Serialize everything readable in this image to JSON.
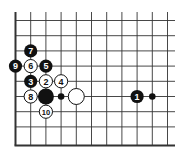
{
  "diagram": {
    "type": "go-board-corner",
    "colors": {
      "background": "#ffffff",
      "line": "#333333",
      "black_stone": "#111111",
      "white_stone": "#ffffff",
      "black_label": "#ffffff",
      "white_label": "#111111"
    },
    "grid": {
      "columns": 11,
      "rows": 9,
      "left_edge": true,
      "bottom_edge": true
    },
    "stones": [
      {
        "col": 8,
        "row": 5,
        "color": "black",
        "label": "1",
        "kind": "move"
      },
      {
        "col": 2,
        "row": 4,
        "color": "white",
        "label": "2",
        "kind": "move"
      },
      {
        "col": 1,
        "row": 4,
        "color": "black",
        "label": "3",
        "kind": "move"
      },
      {
        "col": 3,
        "row": 4,
        "color": "white",
        "label": "4",
        "kind": "move"
      },
      {
        "col": 2,
        "row": 3,
        "color": "black",
        "label": "5",
        "kind": "move"
      },
      {
        "col": 1,
        "row": 3,
        "color": "white",
        "label": "6",
        "kind": "move"
      },
      {
        "col": 1,
        "row": 2,
        "color": "black",
        "label": "7",
        "kind": "move"
      },
      {
        "col": 1,
        "row": 5,
        "color": "white",
        "label": "8",
        "kind": "move"
      },
      {
        "col": 0,
        "row": 3,
        "color": "black",
        "label": "9",
        "kind": "move"
      },
      {
        "col": 2,
        "row": 6,
        "color": "white",
        "label": "10",
        "kind": "move"
      },
      {
        "col": 2,
        "row": 5,
        "color": "black",
        "label": "",
        "kind": "existing"
      },
      {
        "col": 4,
        "row": 5,
        "color": "white",
        "label": "",
        "kind": "existing"
      }
    ],
    "markers": [
      {
        "col": 3,
        "row": 5,
        "type": "small-black-dot"
      },
      {
        "col": 9,
        "row": 5,
        "type": "small-black-dot"
      }
    ]
  }
}
